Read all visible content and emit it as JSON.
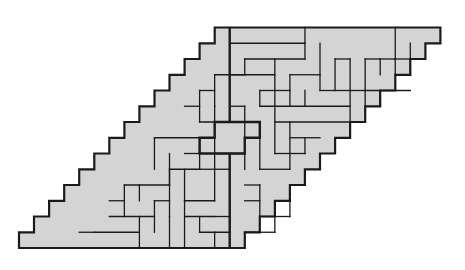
{
  "diagram": {
    "title": "",
    "type": "polyomino tiling of a staircase parallelogram",
    "fill_color": "#d4d4d4",
    "line_color": "#1a1a1a",
    "background": "#ffffff",
    "grid": {
      "origin_x": 19,
      "origin_y": 27.5,
      "cell_w": 15.05,
      "cell_h": 15.75,
      "rows": 14,
      "cols_per_row": 15,
      "top_row_start_col": 13
    },
    "thin_segments": [
      [
        14,
        1,
        19,
        1
      ],
      [
        19,
        1,
        19,
        2
      ],
      [
        15,
        2,
        19,
        2
      ],
      [
        15,
        2,
        15,
        3
      ],
      [
        14,
        3,
        15,
        3
      ],
      [
        17,
        2,
        17,
        5
      ],
      [
        18,
        3,
        18,
        4
      ],
      [
        18,
        3,
        20,
        3
      ],
      [
        20,
        1,
        20,
        4
      ],
      [
        16,
        4,
        18,
        4
      ],
      [
        16,
        4,
        16,
        5
      ],
      [
        16,
        5,
        19,
        5
      ],
      [
        19,
        4,
        19,
        5
      ],
      [
        20,
        4,
        22,
        4
      ],
      [
        22,
        4,
        22,
        6
      ],
      [
        19,
        5,
        22,
        5
      ],
      [
        18,
        4,
        18,
        5
      ],
      [
        17,
        6,
        22,
        6
      ],
      [
        17,
        5,
        17,
        8
      ],
      [
        19,
        0,
        19,
        1
      ],
      [
        22,
        2,
        22,
        4
      ],
      [
        21,
        2,
        21,
        4
      ],
      [
        21,
        2,
        22,
        2
      ],
      [
        23,
        2,
        23,
        4
      ],
      [
        22,
        4,
        23,
        4
      ],
      [
        25,
        0,
        25,
        2
      ],
      [
        24,
        2,
        25,
        2
      ],
      [
        24,
        2,
        24,
        3
      ],
      [
        23,
        2,
        24,
        2
      ],
      [
        25,
        2,
        26,
        2
      ],
      [
        26,
        1,
        26,
        3
      ],
      [
        25,
        3,
        26,
        3
      ],
      [
        25,
        2,
        25,
        3
      ],
      [
        23,
        4,
        26,
        4
      ],
      [
        23,
        4,
        23,
        5
      ],
      [
        24,
        4,
        24,
        5
      ],
      [
        13,
        3,
        17,
        3
      ],
      [
        13,
        3,
        13,
        5
      ],
      [
        12,
        4,
        13,
        4
      ],
      [
        12,
        4,
        12,
        6
      ],
      [
        11,
        5,
        12,
        5
      ],
      [
        12,
        6,
        15,
        6
      ],
      [
        13,
        5,
        13,
        8
      ],
      [
        14,
        5,
        15,
        5
      ],
      [
        15,
        5,
        15,
        7
      ],
      [
        15,
        7,
        16,
        7
      ],
      [
        16,
        7,
        16,
        9
      ],
      [
        18,
        6,
        18,
        9
      ],
      [
        16,
        9,
        18,
        9
      ],
      [
        17,
        8,
        19,
        8
      ],
      [
        19,
        7,
        19,
        8
      ],
      [
        18,
        7,
        20,
        7
      ],
      [
        15,
        10,
        16,
        10
      ],
      [
        16,
        10,
        16,
        12
      ],
      [
        16,
        12,
        18,
        12
      ],
      [
        18,
        10,
        18,
        12
      ],
      [
        17,
        11,
        18,
        11
      ],
      [
        17,
        11,
        17,
        12
      ],
      [
        15,
        11,
        16,
        11
      ],
      [
        15,
        13,
        17,
        13
      ],
      [
        17,
        12,
        17,
        13
      ],
      [
        9,
        7,
        12,
        7
      ],
      [
        9,
        7,
        9,
        9
      ],
      [
        10,
        8,
        10,
        10
      ],
      [
        11,
        8,
        12,
        8
      ],
      [
        12,
        7,
        12,
        9
      ],
      [
        10,
        9,
        12,
        9
      ],
      [
        11,
        9,
        11,
        11
      ],
      [
        11,
        11,
        13,
        11
      ],
      [
        13,
        8,
        13,
        11
      ],
      [
        13,
        8,
        15,
        8
      ],
      [
        15,
        8,
        15,
        9
      ],
      [
        13,
        9,
        14,
        9
      ],
      [
        7,
        10,
        10,
        10
      ],
      [
        7,
        10,
        7,
        12
      ],
      [
        8,
        10,
        8,
        11
      ],
      [
        10,
        10,
        10,
        12
      ],
      [
        9,
        11,
        10,
        11
      ],
      [
        9,
        11,
        9,
        12
      ],
      [
        6,
        11,
        7,
        11
      ],
      [
        6,
        12,
        9,
        12
      ],
      [
        9,
        12,
        9,
        13
      ],
      [
        8,
        12,
        8,
        14
      ],
      [
        5,
        13,
        8,
        13
      ],
      [
        10,
        12,
        10,
        14
      ],
      [
        11,
        11,
        11,
        14
      ],
      [
        11,
        12,
        13,
        12
      ],
      [
        12,
        12,
        12,
        13
      ],
      [
        12,
        13,
        14,
        13
      ],
      [
        13,
        12,
        14,
        12
      ],
      [
        14,
        11,
        14,
        12
      ],
      [
        14,
        12,
        14,
        13
      ],
      [
        13,
        13,
        13,
        14
      ],
      [
        4,
        13,
        5,
        13
      ],
      [
        12,
        9,
        13,
        9
      ],
      [
        10,
        9,
        10,
        10
      ]
    ],
    "thick_path": [
      [
        14,
        0
      ],
      [
        14,
        6
      ],
      [
        16,
        6
      ],
      [
        16,
        7
      ],
      [
        15,
        7
      ],
      [
        15,
        8
      ],
      [
        12,
        8
      ],
      [
        12,
        7
      ],
      [
        13,
        7
      ],
      [
        13,
        6
      ],
      [
        14,
        6
      ]
    ],
    "thick_lower": [
      [
        14,
        8
      ],
      [
        14,
        14
      ]
    ]
  }
}
